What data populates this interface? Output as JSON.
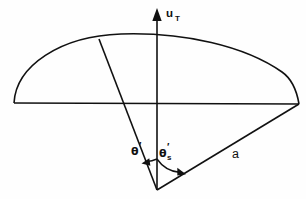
{
  "figure": {
    "title": "",
    "background_color": "#fefefe",
    "stroke_color": "#111111",
    "labels": {
      "velocity_symbol": "u",
      "velocity_subscript": "T",
      "theta_symbol": "θ",
      "theta_prime": "′",
      "theta_s_symbol": "θ",
      "theta_s_prime": "′",
      "theta_s_subscript": "s",
      "radius_label": "a"
    },
    "elements": [
      {
        "name": "dome-arc",
        "type": "arc",
        "description": "shallow dome arc spanning left baseline end to right baseline end"
      },
      {
        "name": "baseline",
        "type": "line",
        "description": "horizontal chord across the dome"
      },
      {
        "name": "vertical-axis-arrow",
        "type": "arrow",
        "description": "vertical arrow pointing up from the apex through the dome"
      },
      {
        "name": "theta-ray",
        "type": "line",
        "description": "slanted ray from apex to left portion of the dome arc"
      },
      {
        "name": "radius-ray",
        "type": "line",
        "description": "ray labelled a from apex to right end of the baseline"
      },
      {
        "name": "theta-angle-arc",
        "type": "arc-arrow",
        "description": "angle arc from vertical axis to theta ray"
      },
      {
        "name": "theta-s-angle-arc",
        "type": "arc-arrow",
        "description": "angle arc from vertical axis to radius ray"
      }
    ],
    "geometry": {
      "apex": [
        157,
        190
      ],
      "baseline_left": [
        14,
        103
      ],
      "baseline_right": [
        299,
        104
      ],
      "dome_apex": [
        157,
        34
      ],
      "theta_ray_end": [
        99,
        39
      ],
      "axis_arrow_tip": [
        157,
        9
      ]
    }
  }
}
